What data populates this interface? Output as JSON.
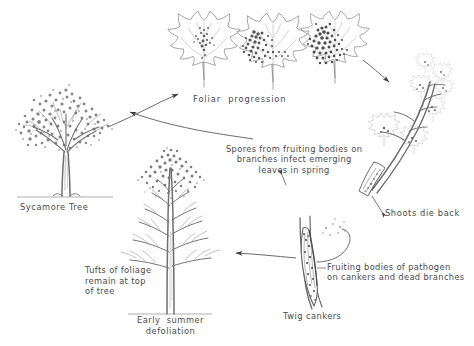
{
  "diagram": {
    "ink_color": "#4a4a4a",
    "background_color": "#ffffff",
    "labels": {
      "foliar_progression": "Foliar  progression",
      "sycamore_tree": "Sycamore Tree",
      "spores": "Spores from fruiting bodies on\nbranches infect emerging\nleaves in spring",
      "shoots_die_back": "Shoots die back",
      "fruiting_bodies": "Fruiting bodies of pathogen\non cankers and dead branches",
      "twig_cankers": "Twig cankers",
      "tufts_of_foliage": "Tufts of foliage\nremain at top\nof tree",
      "early_summer_defoliation": "Early  summer\ndefoliation"
    },
    "illustrations": [
      {
        "name": "healthy-sycamore-tree",
        "caption": "Sycamore Tree"
      },
      {
        "name": "infected-leaf-stage-1",
        "caption": "Foliar  progression"
      },
      {
        "name": "infected-leaf-stage-2",
        "caption": "Foliar  progression"
      },
      {
        "name": "infected-leaf-stage-3",
        "caption": "Foliar  progression"
      },
      {
        "name": "dying-shoot-with-canker",
        "caption": "Shoots die back"
      },
      {
        "name": "twig-canker-with-fruiting-bodies",
        "caption": "Twig cankers"
      },
      {
        "name": "defoliated-tree",
        "caption": "Early  summer\ndefoliation"
      }
    ],
    "arrows": [
      {
        "name": "arrow-tree-to-leaves",
        "from": "healthy-sycamore-tree",
        "to": "infected-leaf-stage-1"
      },
      {
        "name": "arrow-leaves-to-shoot",
        "from": "infected-leaf-stage-3",
        "to": "dying-shoot-with-canker"
      },
      {
        "name": "arrow-cankers-to-defoliated-tree",
        "from": "twig-canker-with-fruiting-bodies",
        "to": "defoliated-tree"
      },
      {
        "name": "arrow-spores-to-tree",
        "from": "spores-caption",
        "to": "healthy-sycamore-tree"
      }
    ]
  }
}
